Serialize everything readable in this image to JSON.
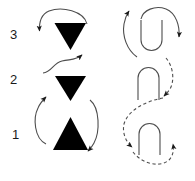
{
  "figure": {
    "title": "",
    "background_color": "#ffffff",
    "ink_color": "#000000",
    "line_color": "#4d4d4d",
    "width": 195,
    "height": 181
  },
  "row_labels": [
    {
      "id": "label-3",
      "text": "3"
    },
    {
      "id": "label-2",
      "text": "2"
    },
    {
      "id": "label-1",
      "text": "1"
    }
  ],
  "left_column": {
    "description": "Stack of three solid black triangles",
    "shapes": [
      {
        "row": "3",
        "name": "triangle-down-row3",
        "orientation": "down",
        "fill": "#000000"
      },
      {
        "row": "2",
        "name": "triangle-down-row2",
        "orientation": "down",
        "fill": "#000000"
      },
      {
        "row": "1",
        "name": "triangle-up-row1",
        "orientation": "up",
        "fill": "#000000"
      }
    ],
    "arrows": [
      {
        "name": "arrow-row3-over-top",
        "style": "solid",
        "head": "down-left"
      },
      {
        "name": "arrow-row2-s-curve",
        "style": "solid",
        "head": "up-right"
      },
      {
        "name": "arrow-row1-left-up",
        "style": "solid",
        "head": "up"
      },
      {
        "name": "arrow-row1-right-down",
        "style": "solid",
        "head": "down-right"
      }
    ]
  },
  "right_column": {
    "description": "Stack of three rounded U / arch outlines with curved arrows",
    "shapes": [
      {
        "row": "3",
        "name": "u-shape-row3",
        "orientation": "u",
        "fill": "none"
      },
      {
        "row": "2",
        "name": "arch-shape-row2",
        "orientation": "arch",
        "fill": "none"
      },
      {
        "row": "1",
        "name": "arch-shape-row1",
        "orientation": "arch",
        "fill": "none"
      }
    ],
    "arrows": [
      {
        "name": "arrow-row3-left-up",
        "style": "solid",
        "head": "up"
      },
      {
        "name": "arrow-row3-right-down",
        "style": "solid",
        "head": "right"
      },
      {
        "name": "arrow-row2-dashed-down",
        "style": "dashed",
        "head": "down-right"
      },
      {
        "name": "arrow-row1-dashed-left",
        "style": "dashed",
        "head": "left"
      },
      {
        "name": "arrow-row1-dashed-up",
        "style": "dashed",
        "head": "up"
      }
    ]
  }
}
